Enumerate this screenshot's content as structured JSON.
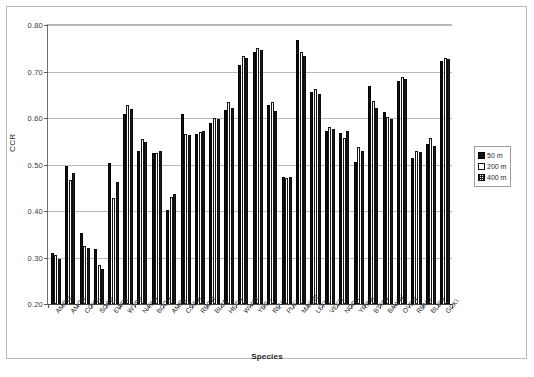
{
  "chart_data": {
    "type": "bar",
    "title": "",
    "xlabel": "Species",
    "ylabel": "CCR",
    "ylim": [
      0.2,
      0.8
    ],
    "ytick_values": [
      0.2,
      0.3,
      0.4,
      0.5,
      0.6,
      0.7,
      0.8
    ],
    "ytick_labels": [
      "0.20",
      "0.30",
      "0.40",
      "0.50",
      "0.60",
      "0.70",
      "0.80"
    ],
    "grid": true,
    "legend_position": "right",
    "categories": [
      "AMRO",
      "AMCR",
      "COYE",
      "SOSP",
      "EWPE",
      "WTSP",
      "NAWA",
      "BCCH",
      "AMRE",
      "CSWA",
      "RBGR",
      "BLJA",
      "HETH",
      "WIWR",
      "YBSA",
      "REVI",
      "PUFI",
      "MAGW",
      "LEFL",
      "VEER",
      "NOPA",
      "YRWA",
      "BTNW",
      "BAWW",
      "OVEN",
      "RBNU",
      "BLBW",
      "GCKI"
    ],
    "series": [
      {
        "name": "50 m",
        "color": "#111111",
        "values": [
          0.31,
          0.497,
          0.353,
          0.318,
          0.504,
          0.608,
          0.53,
          0.525,
          0.402,
          0.608,
          0.565,
          0.59,
          0.618,
          0.715,
          0.743,
          0.628,
          0.473,
          0.767,
          0.657,
          0.573,
          0.567,
          0.505,
          0.668,
          0.613,
          0.68,
          0.513,
          0.545,
          0.723
        ]
      },
      {
        "name": "200 m",
        "color": "#ffffff",
        "values": [
          0.306,
          0.467,
          0.325,
          0.283,
          0.427,
          0.627,
          0.555,
          0.524,
          0.431,
          0.566,
          0.57,
          0.601,
          0.635,
          0.733,
          0.75,
          0.634,
          0.47,
          0.743,
          0.663,
          0.58,
          0.558,
          0.537,
          0.636,
          0.603,
          0.688,
          0.53,
          0.557,
          0.728
        ]
      },
      {
        "name": "400 m",
        "color": "#b0b0b0",
        "values": [
          0.297,
          0.481,
          0.321,
          0.275,
          0.463,
          0.62,
          0.548,
          0.53,
          0.437,
          0.563,
          0.572,
          0.597,
          0.622,
          0.73,
          0.747,
          0.615,
          0.474,
          0.733,
          0.651,
          0.577,
          0.573,
          0.53,
          0.621,
          0.597,
          0.683,
          0.527,
          0.54,
          0.726
        ]
      }
    ]
  },
  "legend": {
    "entries": [
      {
        "label": "50 m",
        "style": "s50"
      },
      {
        "label": "200 m",
        "style": "s200"
      },
      {
        "label": "400 m",
        "style": "s400"
      }
    ]
  }
}
